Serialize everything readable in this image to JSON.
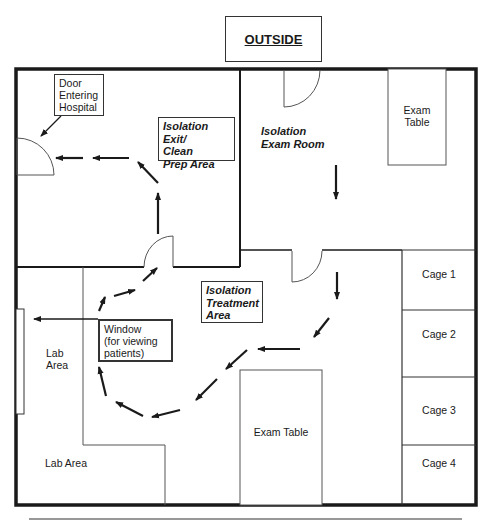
{
  "outside_label": "OUTSIDE",
  "rooms": {
    "exit_area": "Isolation Exit/\nClean\nPrep Area",
    "exam_room": "Isolation\nExam Room",
    "treatment_area": "Isolation\nTreatment\nArea",
    "lab_area_upper": "Lab\nArea",
    "lab_area_lower": "Lab Area"
  },
  "callouts": {
    "door_entering": "Door\nEntering\nHospital",
    "window_viewing": "Window\n (for viewing\npatients)"
  },
  "furniture": {
    "exam_table_top": "Exam\nTable",
    "exam_table_bottom": "Exam Table"
  },
  "cages": [
    "Cage 1",
    "Cage 2",
    "Cage 3",
    "Cage 4"
  ],
  "colors": {
    "line": "#1a1a1a",
    "thin_line": "#555555",
    "background": "#ffffff"
  }
}
